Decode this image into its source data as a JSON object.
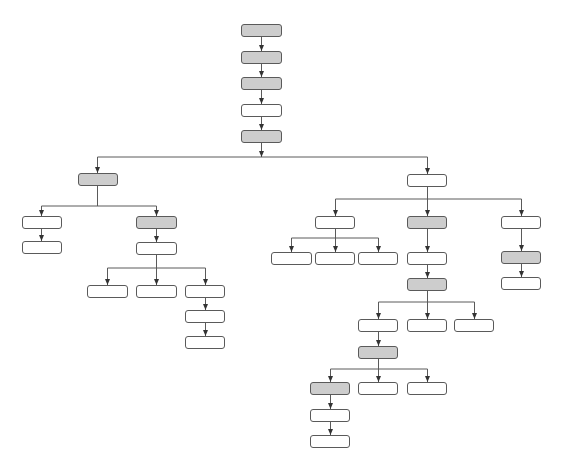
{
  "diagram": {
    "type": "tree-flowchart",
    "colors": {
      "shaded_fill": "#cdcdcd",
      "plain_fill": "#ffffff",
      "stroke": "#5a5a5a",
      "background": "#ffffff"
    },
    "nodes": [
      {
        "id": "n1",
        "x": 241,
        "y": 24,
        "w": 41,
        "h": 13,
        "shaded": true,
        "label": ""
      },
      {
        "id": "n2",
        "x": 241,
        "y": 51,
        "w": 41,
        "h": 13,
        "shaded": true,
        "label": ""
      },
      {
        "id": "n3",
        "x": 241,
        "y": 77,
        "w": 41,
        "h": 13,
        "shaded": true,
        "label": ""
      },
      {
        "id": "n4",
        "x": 241,
        "y": 104,
        "w": 41,
        "h": 13,
        "shaded": false,
        "label": ""
      },
      {
        "id": "n5",
        "x": 241,
        "y": 130,
        "w": 41,
        "h": 13,
        "shaded": true,
        "label": ""
      },
      {
        "id": "L1",
        "x": 78,
        "y": 173,
        "w": 40,
        "h": 13,
        "shaded": true,
        "label": ""
      },
      {
        "id": "L2a",
        "x": 22,
        "y": 216,
        "w": 40,
        "h": 13,
        "shaded": false,
        "label": ""
      },
      {
        "id": "L2b",
        "x": 22,
        "y": 241,
        "w": 40,
        "h": 13,
        "shaded": false,
        "label": ""
      },
      {
        "id": "L3a",
        "x": 136,
        "y": 216,
        "w": 41,
        "h": 13,
        "shaded": true,
        "label": ""
      },
      {
        "id": "L3b",
        "x": 136,
        "y": 242,
        "w": 41,
        "h": 13,
        "shaded": false,
        "label": ""
      },
      {
        "id": "L4a",
        "x": 87,
        "y": 285,
        "w": 41,
        "h": 13,
        "shaded": false,
        "label": ""
      },
      {
        "id": "L4b",
        "x": 136,
        "y": 285,
        "w": 41,
        "h": 13,
        "shaded": false,
        "label": ""
      },
      {
        "id": "L4c",
        "x": 185,
        "y": 285,
        "w": 40,
        "h": 13,
        "shaded": false,
        "label": ""
      },
      {
        "id": "L5",
        "x": 185,
        "y": 310,
        "w": 40,
        "h": 13,
        "shaded": false,
        "label": ""
      },
      {
        "id": "L6",
        "x": 185,
        "y": 336,
        "w": 40,
        "h": 13,
        "shaded": false,
        "label": ""
      },
      {
        "id": "R1",
        "x": 407,
        "y": 174,
        "w": 40,
        "h": 13,
        "shaded": false,
        "label": ""
      },
      {
        "id": "R2a",
        "x": 315,
        "y": 216,
        "w": 40,
        "h": 13,
        "shaded": false,
        "label": ""
      },
      {
        "id": "R2b",
        "x": 407,
        "y": 216,
        "w": 40,
        "h": 13,
        "shaded": true,
        "label": ""
      },
      {
        "id": "R2c",
        "x": 501,
        "y": 216,
        "w": 40,
        "h": 13,
        "shaded": false,
        "label": ""
      },
      {
        "id": "R3a",
        "x": 271,
        "y": 252,
        "w": 41,
        "h": 13,
        "shaded": false,
        "label": ""
      },
      {
        "id": "R3b",
        "x": 315,
        "y": 252,
        "w": 40,
        "h": 13,
        "shaded": false,
        "label": ""
      },
      {
        "id": "R3c",
        "x": 358,
        "y": 252,
        "w": 40,
        "h": 13,
        "shaded": false,
        "label": ""
      },
      {
        "id": "R3d",
        "x": 407,
        "y": 252,
        "w": 40,
        "h": 13,
        "shaded": false,
        "label": ""
      },
      {
        "id": "R3e",
        "x": 501,
        "y": 251,
        "w": 40,
        "h": 13,
        "shaded": true,
        "label": ""
      },
      {
        "id": "R4e",
        "x": 501,
        "y": 277,
        "w": 40,
        "h": 13,
        "shaded": false,
        "label": ""
      },
      {
        "id": "R4d",
        "x": 407,
        "y": 278,
        "w": 40,
        "h": 13,
        "shaded": true,
        "label": ""
      },
      {
        "id": "R5a",
        "x": 358,
        "y": 319,
        "w": 40,
        "h": 13,
        "shaded": false,
        "label": ""
      },
      {
        "id": "R5b",
        "x": 407,
        "y": 319,
        "w": 40,
        "h": 13,
        "shaded": false,
        "label": ""
      },
      {
        "id": "R5c",
        "x": 454,
        "y": 319,
        "w": 40,
        "h": 13,
        "shaded": false,
        "label": ""
      },
      {
        "id": "R6",
        "x": 358,
        "y": 346,
        "w": 40,
        "h": 13,
        "shaded": true,
        "label": ""
      },
      {
        "id": "R7a",
        "x": 310,
        "y": 382,
        "w": 40,
        "h": 13,
        "shaded": true,
        "label": ""
      },
      {
        "id": "R7b",
        "x": 358,
        "y": 382,
        "w": 40,
        "h": 13,
        "shaded": false,
        "label": ""
      },
      {
        "id": "R7c",
        "x": 407,
        "y": 382,
        "w": 40,
        "h": 13,
        "shaded": false,
        "label": ""
      },
      {
        "id": "R8",
        "x": 310,
        "y": 409,
        "w": 40,
        "h": 13,
        "shaded": false,
        "label": ""
      },
      {
        "id": "R9",
        "x": 310,
        "y": 435,
        "w": 40,
        "h": 13,
        "shaded": false,
        "label": ""
      }
    ],
    "lines": [
      [
        261,
        37,
        261,
        51
      ],
      [
        261,
        64,
        261,
        77
      ],
      [
        261,
        90,
        261,
        104
      ],
      [
        261,
        117,
        261,
        130
      ],
      [
        261,
        143,
        261,
        157
      ],
      [
        97,
        157,
        427,
        157
      ],
      [
        97,
        157,
        97,
        173
      ],
      [
        427,
        157,
        427,
        174
      ],
      [
        97,
        186,
        97,
        206
      ],
      [
        41,
        206,
        156,
        206
      ],
      [
        41,
        206,
        41,
        216
      ],
      [
        156,
        206,
        156,
        216
      ],
      [
        41,
        229,
        41,
        241
      ],
      [
        156,
        229,
        156,
        242
      ],
      [
        156,
        255,
        156,
        268
      ],
      [
        107,
        268,
        205,
        268
      ],
      [
        107,
        268,
        107,
        285
      ],
      [
        156,
        268,
        156,
        285
      ],
      [
        205,
        268,
        205,
        285
      ],
      [
        205,
        298,
        205,
        310
      ],
      [
        205,
        323,
        205,
        336
      ],
      [
        427,
        187,
        427,
        216
      ],
      [
        335,
        199,
        521,
        199
      ],
      [
        335,
        199,
        335,
        216
      ],
      [
        521,
        199,
        521,
        216
      ],
      [
        335,
        229,
        335,
        238
      ],
      [
        291,
        238,
        378,
        238
      ],
      [
        291,
        238,
        291,
        252
      ],
      [
        335,
        238,
        335,
        252
      ],
      [
        378,
        238,
        378,
        252
      ],
      [
        427,
        229,
        427,
        252
      ],
      [
        427,
        265,
        427,
        278
      ],
      [
        521,
        229,
        521,
        251
      ],
      [
        521,
        264,
        521,
        277
      ],
      [
        427,
        291,
        427,
        302
      ],
      [
        378,
        302,
        474,
        302
      ],
      [
        378,
        302,
        378,
        319
      ],
      [
        427,
        302,
        427,
        319
      ],
      [
        474,
        302,
        474,
        319
      ],
      [
        378,
        332,
        378,
        346
      ],
      [
        378,
        359,
        378,
        369
      ],
      [
        330,
        369,
        427,
        369
      ],
      [
        330,
        369,
        330,
        382
      ],
      [
        378,
        369,
        378,
        382
      ],
      [
        427,
        369,
        427,
        382
      ],
      [
        330,
        395,
        330,
        409
      ],
      [
        330,
        422,
        330,
        435
      ]
    ],
    "arrows": [
      [
        261,
        51
      ],
      [
        261,
        77
      ],
      [
        261,
        104
      ],
      [
        261,
        130
      ],
      [
        261,
        157
      ],
      [
        97,
        173
      ],
      [
        427,
        174
      ],
      [
        41,
        216
      ],
      [
        156,
        216
      ],
      [
        41,
        241
      ],
      [
        156,
        242
      ],
      [
        107,
        285
      ],
      [
        156,
        285
      ],
      [
        205,
        285
      ],
      [
        205,
        310
      ],
      [
        205,
        336
      ],
      [
        335,
        216
      ],
      [
        427,
        216
      ],
      [
        521,
        216
      ],
      [
        291,
        252
      ],
      [
        335,
        252
      ],
      [
        378,
        252
      ],
      [
        427,
        252
      ],
      [
        427,
        278
      ],
      [
        521,
        251
      ],
      [
        521,
        277
      ],
      [
        378,
        319
      ],
      [
        427,
        319
      ],
      [
        474,
        319
      ],
      [
        378,
        346
      ],
      [
        330,
        382
      ],
      [
        378,
        382
      ],
      [
        427,
        382
      ],
      [
        330,
        409
      ],
      [
        330,
        435
      ]
    ]
  }
}
